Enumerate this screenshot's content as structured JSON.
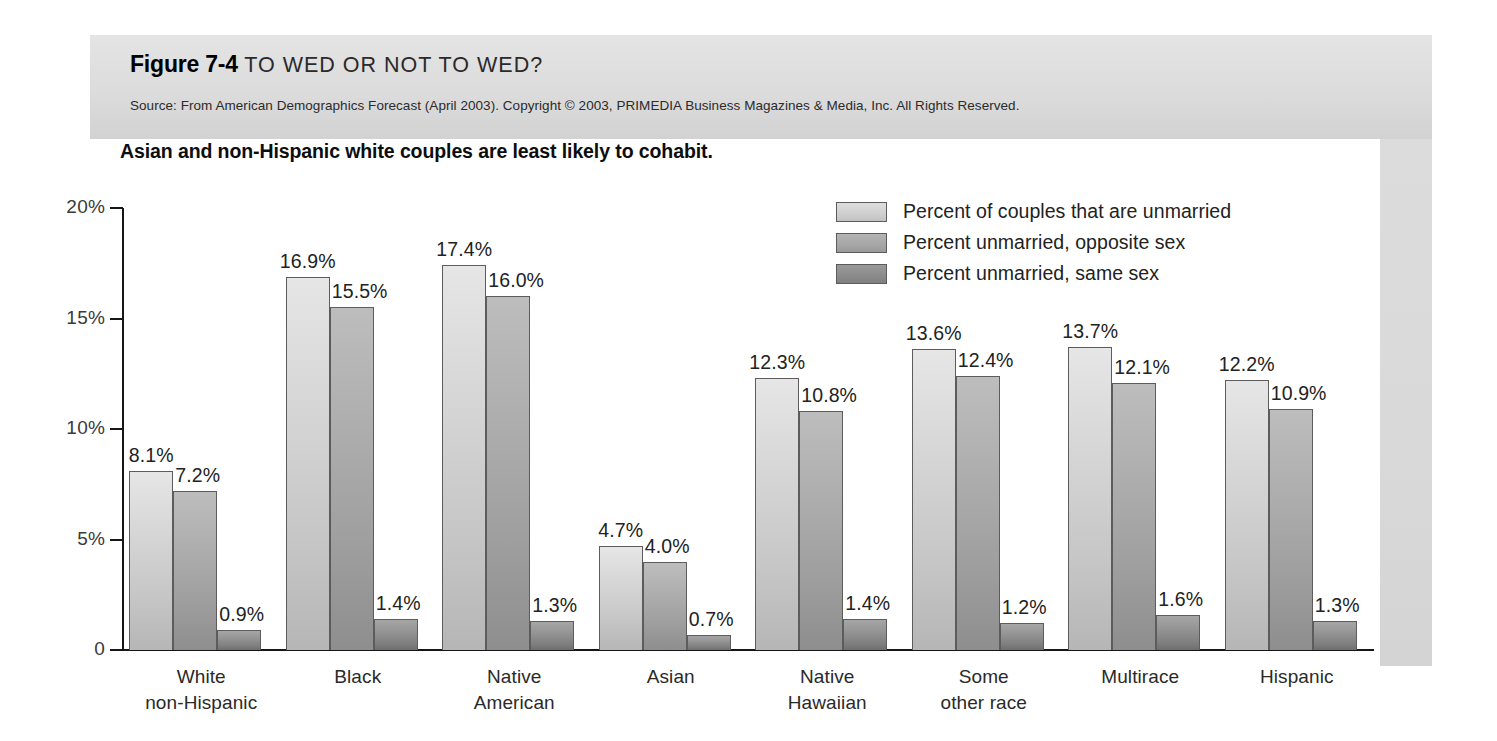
{
  "figure": {
    "number": "Figure 7-4",
    "name": "TO WED OR NOT TO WED?",
    "source": "Source: From American Demographics Forecast (April 2003). Copyright © 2003, PRIMEDIA Business Magazines & Media, Inc. All Rights Reserved."
  },
  "chart_data": {
    "type": "bar",
    "title": "Asian and non-Hispanic white couples are least likely to cohabit.",
    "xlabel": "",
    "ylabel": "",
    "ylim": [
      0,
      20
    ],
    "grid": false,
    "legend_position": "top-right",
    "ytick_labels": [
      "0",
      "5%",
      "10%",
      "15%",
      "20%"
    ],
    "ytick_values": [
      0,
      5,
      10,
      15,
      20
    ],
    "categories": [
      "White\nnon-Hispanic",
      "Black",
      "Native\nAmerican",
      "Asian",
      "Native\nHawaiian",
      "Some\nother race",
      "Multirace",
      "Hispanic"
    ],
    "category_lines": [
      [
        "White",
        "non-Hispanic"
      ],
      [
        "Black",
        ""
      ],
      [
        "Native",
        "American"
      ],
      [
        "Asian",
        ""
      ],
      [
        "Native",
        "Hawaiian"
      ],
      [
        "Some",
        "other race"
      ],
      [
        "Multirace",
        ""
      ],
      [
        "Hispanic",
        ""
      ]
    ],
    "series": [
      {
        "name": "Percent of couples that are unmarried",
        "color": "#cfcfcf",
        "values": [
          8.1,
          16.9,
          17.4,
          4.7,
          12.3,
          13.6,
          13.7,
          12.2
        ],
        "labels": [
          "8.1%",
          "16.9%",
          "17.4%",
          "4.7%",
          "12.3%",
          "13.6%",
          "13.7%",
          "12.2%"
        ]
      },
      {
        "name": "Percent unmarried, opposite sex",
        "color": "#a6a6a6",
        "values": [
          7.2,
          15.5,
          16.0,
          4.0,
          10.8,
          12.4,
          12.1,
          10.9
        ],
        "labels": [
          "7.2%",
          "15.5%",
          "16.0%",
          "4.0%",
          "10.8%",
          "12.4%",
          "12.1%",
          "10.9%"
        ]
      },
      {
        "name": "Percent unmarried, same sex",
        "color": "#8b8b8b",
        "values": [
          0.9,
          1.4,
          1.3,
          0.7,
          1.4,
          1.2,
          1.6,
          1.3
        ],
        "labels": [
          "0.9%",
          "1.4%",
          "1.3%",
          "0.7%",
          "1.4%",
          "1.2%",
          "1.6%",
          "1.3%"
        ]
      }
    ]
  }
}
